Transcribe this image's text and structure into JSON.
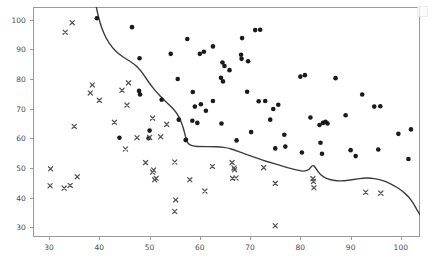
{
  "chart_data": {
    "type": "scatter",
    "title": "",
    "xlabel": "",
    "ylabel": "",
    "xlim": [
      26.8,
      103.8
    ],
    "ylim": [
      26.7,
      104.3
    ],
    "xticks": [
      30,
      40,
      50,
      60,
      70,
      80,
      90,
      100
    ],
    "yticks": [
      30,
      40,
      50,
      60,
      70,
      80,
      90,
      100
    ],
    "xtick_labels": [
      "30",
      "40",
      "50",
      "60",
      "70",
      "80",
      "90",
      "100"
    ],
    "ytick_labels": [
      "30",
      "40",
      "50",
      "60",
      "70",
      "80",
      "90",
      "100"
    ],
    "grid": false,
    "legend_position": "upper right",
    "marker_colors": {
      "circle": "#1a1a1a",
      "cross": "#555555",
      "boundary_line": "#3d3d3d",
      "frame": "#9a9a9a",
      "tick_text": "#4d4d4d",
      "background": "#ffffff"
    },
    "series": [
      {
        "name": "class-1-circles",
        "marker": "circle",
        "color": "#1a1a1a",
        "marker_size": 4.6,
        "points": [
          [
            46.5,
            97.5
          ],
          [
            39.5,
            100.5
          ],
          [
            48.0,
            87.0
          ],
          [
            54.2,
            88.5
          ],
          [
            60.8,
            89.2
          ],
          [
            71.0,
            96.5
          ],
          [
            72.0,
            96.6
          ],
          [
            69.6,
            86.0
          ],
          [
            58.6,
            75.6
          ],
          [
            69.4,
            75.7
          ],
          [
            61.2,
            69.3
          ],
          [
            64.3,
            65.0
          ],
          [
            71.7,
            72.5
          ],
          [
            73.0,
            72.6
          ],
          [
            74.6,
            69.9
          ],
          [
            57.2,
            59.5
          ],
          [
            57.5,
            93.5
          ],
          [
            62.6,
            91.0
          ],
          [
            68.4,
            93.8
          ],
          [
            60.0,
            88.5
          ],
          [
            64.5,
            85.6
          ],
          [
            64.9,
            84.4
          ],
          [
            65.9,
            83.0
          ],
          [
            68.2,
            88.2
          ],
          [
            68.3,
            86.8
          ],
          [
            64.2,
            80.4
          ],
          [
            64.6,
            79.2
          ],
          [
            55.6,
            80.0
          ],
          [
            80.0,
            80.8
          ],
          [
            80.9,
            81.3
          ],
          [
            87.0,
            80.3
          ],
          [
            52.4,
            73.0
          ],
          [
            59.0,
            70.7
          ],
          [
            60.2,
            71.5
          ],
          [
            62.6,
            72.6
          ],
          [
            47.9,
            76.0
          ],
          [
            48.1,
            74.8
          ],
          [
            75.6,
            71.3
          ],
          [
            92.3,
            74.8
          ],
          [
            94.7,
            70.7
          ],
          [
            95.9,
            70.8
          ],
          [
            55.8,
            66.3
          ],
          [
            58.5,
            65.9
          ],
          [
            59.5,
            65.2
          ],
          [
            74.0,
            66.3
          ],
          [
            89.0,
            67.8
          ],
          [
            50.0,
            62.6
          ],
          [
            70.2,
            62.1
          ],
          [
            82.0,
            67.0
          ],
          [
            84.5,
            65.2
          ],
          [
            85.0,
            65.6
          ],
          [
            57.2,
            59.4
          ],
          [
            67.3,
            59.3
          ],
          [
            76.8,
            61.2
          ],
          [
            83.8,
            64.5
          ],
          [
            85.4,
            65.0
          ],
          [
            75.0,
            56.6
          ],
          [
            77.0,
            57.2
          ],
          [
            80.3,
            55.2
          ],
          [
            84.0,
            58.5
          ],
          [
            84.3,
            54.8
          ],
          [
            90.0,
            56.0
          ],
          [
            91.0,
            54.0
          ],
          [
            95.5,
            56.2
          ],
          [
            99.5,
            61.5
          ],
          [
            101.5,
            53.0
          ],
          [
            102.0,
            63.0
          ],
          [
            44.0,
            60.2
          ],
          [
            49.8,
            60.0
          ]
        ]
      },
      {
        "name": "class-0-crosses",
        "marker": "x",
        "color": "#555555",
        "marker_size": 4.2,
        "points": [
          [
            34.6,
            99.0
          ],
          [
            33.2,
            95.8
          ],
          [
            38.6,
            78.0
          ],
          [
            38.2,
            75.3
          ],
          [
            40.0,
            72.8
          ],
          [
            44.5,
            76.2
          ],
          [
            45.8,
            78.7
          ],
          [
            45.5,
            71.2
          ],
          [
            43.0,
            65.4
          ],
          [
            50.6,
            66.8
          ],
          [
            53.4,
            64.7
          ],
          [
            47.5,
            60.2
          ],
          [
            50.0,
            60.3
          ],
          [
            52.2,
            60.5
          ],
          [
            35.0,
            64.0
          ],
          [
            45.2,
            56.4
          ],
          [
            30.3,
            49.7
          ],
          [
            30.2,
            44.0
          ],
          [
            33.0,
            43.2
          ],
          [
            34.2,
            44.1
          ],
          [
            35.6,
            47.0
          ],
          [
            49.2,
            51.8
          ],
          [
            50.8,
            49.3
          ],
          [
            50.6,
            48.6
          ],
          [
            51.3,
            46.5
          ],
          [
            51.0,
            46.0
          ],
          [
            55.0,
            52.0
          ],
          [
            62.5,
            50.5
          ],
          [
            61.0,
            42.2
          ],
          [
            55.2,
            39.2
          ],
          [
            55.0,
            35.3
          ],
          [
            66.4,
            51.8
          ],
          [
            66.8,
            50.0
          ],
          [
            66.9,
            49.4
          ],
          [
            72.7,
            50.1
          ],
          [
            66.5,
            46.5
          ],
          [
            67.2,
            46.6
          ],
          [
            75.0,
            44.8
          ],
          [
            82.5,
            46.4
          ],
          [
            82.6,
            45.4
          ],
          [
            82.7,
            43.3
          ],
          [
            93.0,
            41.8
          ],
          [
            96.0,
            41.5
          ],
          [
            75.0,
            30.5
          ],
          [
            58.0,
            46.0
          ]
        ]
      }
    ],
    "boundary_curve": {
      "name": "decision-boundary",
      "color": "#3d3d3d",
      "width": 1.4,
      "points": [
        [
          39.4,
          104.3
        ],
        [
          39.8,
          101.0
        ],
        [
          40.5,
          97.0
        ],
        [
          41.4,
          93.5
        ],
        [
          42.6,
          90.5
        ],
        [
          44.0,
          88.2
        ],
        [
          45.6,
          86.5
        ],
        [
          47.0,
          85.0
        ],
        [
          48.2,
          83.0
        ],
        [
          49.2,
          80.5
        ],
        [
          50.2,
          78.0
        ],
        [
          51.4,
          75.5
        ],
        [
          52.8,
          73.0
        ],
        [
          54.2,
          70.8
        ],
        [
          55.4,
          68.6
        ],
        [
          56.2,
          66.0
        ],
        [
          56.8,
          63.0
        ],
        [
          57.2,
          60.2
        ],
        [
          57.6,
          58.2
        ],
        [
          58.5,
          57.3
        ],
        [
          60.5,
          57.2
        ],
        [
          62.5,
          57.2
        ],
        [
          64.0,
          57.1
        ],
        [
          65.5,
          56.8
        ],
        [
          67.0,
          56.0
        ],
        [
          68.5,
          55.0
        ],
        [
          70.5,
          53.8
        ],
        [
          72.5,
          52.6
        ],
        [
          74.5,
          51.6
        ],
        [
          76.5,
          50.6
        ],
        [
          78.0,
          49.8
        ],
        [
          79.5,
          49.2
        ],
        [
          80.8,
          48.8
        ],
        [
          81.8,
          49.5
        ],
        [
          82.5,
          51.2
        ],
        [
          83.2,
          49.6
        ],
        [
          84.0,
          47.6
        ],
        [
          85.2,
          46.4
        ],
        [
          86.5,
          45.8
        ],
        [
          88.0,
          45.6
        ],
        [
          89.5,
          45.8
        ],
        [
          91.0,
          46.2
        ],
        [
          92.5,
          46.6
        ],
        [
          94.0,
          46.6
        ],
        [
          95.5,
          46.2
        ],
        [
          97.0,
          45.4
        ],
        [
          98.5,
          44.2
        ],
        [
          100.0,
          42.6
        ],
        [
          101.5,
          40.4
        ],
        [
          102.5,
          38.0
        ],
        [
          103.3,
          35.6
        ],
        [
          103.8,
          34.2
        ]
      ]
    }
  },
  "figure": {
    "legend_placeholder": ""
  }
}
